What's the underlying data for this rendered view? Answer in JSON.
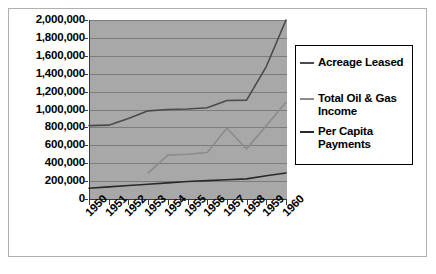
{
  "figure": {
    "background_color": "#ffffff",
    "frame_color": "#b0b0b0",
    "plot_background_color": "#a8a8a8",
    "gridline_color": "#7c7c7c",
    "axis_color": "#3a3a3a"
  },
  "legend": {
    "position": "right",
    "entries": [
      {
        "label": "Acreage Leased",
        "color": "#4a4a4a"
      },
      {
        "label": "Total Oil & Gas Income",
        "color": "#8c8c8c"
      },
      {
        "label": "Per Capita Payments",
        "color": "#2a2a2a"
      }
    ]
  },
  "chart_data": {
    "type": "line",
    "title": "",
    "subtitle": "",
    "xlabel": "",
    "ylabel": "",
    "grid": true,
    "legend_position": "right",
    "categories": [
      "1950",
      "1951",
      "1952",
      "1953",
      "1954",
      "1955",
      "1956",
      "1957",
      "1958",
      "1959",
      "1960"
    ],
    "x_tick_labels": [
      "1950",
      "1951",
      "1952",
      "1953",
      "1954",
      "1955",
      "1956",
      "1957",
      "1958",
      "1959",
      "1960"
    ],
    "y_tick_labels": [
      "2,000,000",
      "1,800,000",
      "1,600,000",
      "1,400,000",
      "1,200,000",
      "1,000,000",
      "800,000",
      "600,000",
      "400,000",
      "200,000",
      "0"
    ],
    "y_tick_values": [
      2000000,
      1800000,
      1600000,
      1400000,
      1200000,
      1000000,
      800000,
      600000,
      400000,
      200000,
      0
    ],
    "ylim": [
      0,
      2000000
    ],
    "series": [
      {
        "name": "Acreage Leased",
        "color": "#4a4a4a",
        "values": [
          820000,
          825000,
          900000,
          985000,
          1000000,
          1005000,
          1020000,
          1100000,
          1105000,
          1480000,
          2000000
        ]
      },
      {
        "name": "Total Oil & Gas Income",
        "color": "#8c8c8c",
        "values": [
          null,
          null,
          null,
          290000,
          490000,
          500000,
          520000,
          790000,
          560000,
          820000,
          1080000
        ]
      },
      {
        "name": "Per Capita Payments",
        "color": "#2a2a2a",
        "values": [
          120000,
          135000,
          150000,
          165000,
          180000,
          195000,
          205000,
          215000,
          225000,
          260000,
          290000
        ]
      }
    ]
  }
}
